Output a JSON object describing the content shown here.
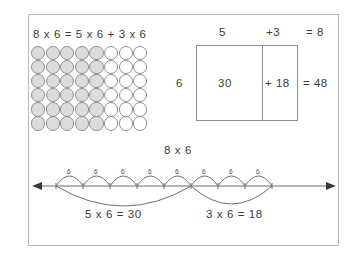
{
  "figure": {
    "title_equation": "8 x 6 = 5 x 6 + 3 x 6",
    "border_color": "#b9b9b9",
    "background": "#ffffff"
  },
  "array_model": {
    "name": "circle-array",
    "columns": 8,
    "rows": 6,
    "shaded_columns": 5,
    "unshaded_columns": 3,
    "shaded_color": "#dcdcdc",
    "unshaded_color": "#ffffff",
    "outline_color": "#8f8f8f",
    "total_circles": 48,
    "shaded_count": 30,
    "unshaded_count": 18
  },
  "area_model": {
    "top_left_label": "5",
    "top_right_label": "+3",
    "top_total_label": "= 8",
    "left_label": "6",
    "cell_left_value": "30",
    "cell_right_value": "+ 18",
    "right_total_label": "= 48",
    "outline_color": "#8d8d8d"
  },
  "number_line": {
    "title": "8 x 6",
    "hop_labels": [
      "6",
      "6",
      "6",
      "6",
      "6",
      "6",
      "6",
      "6"
    ],
    "hop_count": 8,
    "arc_left_label": "5 x 6 = 30",
    "arc_right_label": "3 x 6 = 18",
    "line_color": "#6f6f6f",
    "arrow_left": "left-arrowhead",
    "arrow_right": "right-arrowhead"
  },
  "chart_data": {
    "type": "diagram",
    "representations": [
      {
        "name": "array",
        "dimensions": [
          8,
          6
        ],
        "partition": [
          5,
          3
        ],
        "partial_products": [
          30,
          18
        ],
        "total": 48
      },
      {
        "name": "area-model",
        "width_parts": [
          5,
          3
        ],
        "width_total": 8,
        "height": 6,
        "partial_products": [
          30,
          18
        ],
        "total": 48
      },
      {
        "name": "number-line",
        "jump_size": 6,
        "jump_count": 8,
        "groups": [
          {
            "jumps": 5,
            "expression": "5 x 6 = 30",
            "product": 30
          },
          {
            "jumps": 3,
            "expression": "3 x 6 = 18",
            "product": 18
          }
        ],
        "total": 48
      }
    ]
  }
}
